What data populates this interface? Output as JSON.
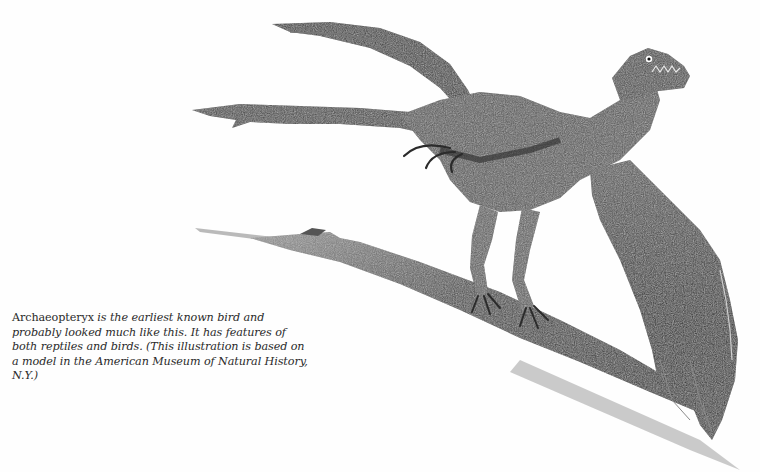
{
  "figure": {
    "style": "pencil-sketch",
    "ink_color": "#2b2b2b",
    "shadow_color": "#b8b8b8"
  },
  "caption": {
    "name": "Archaeopteryx",
    "text_after_name": " is the earliest known bird and probably looked much like this. It has features of both reptiles and birds. (This illustration is based on a model in the American Museum of Natural History, N.Y.)"
  }
}
